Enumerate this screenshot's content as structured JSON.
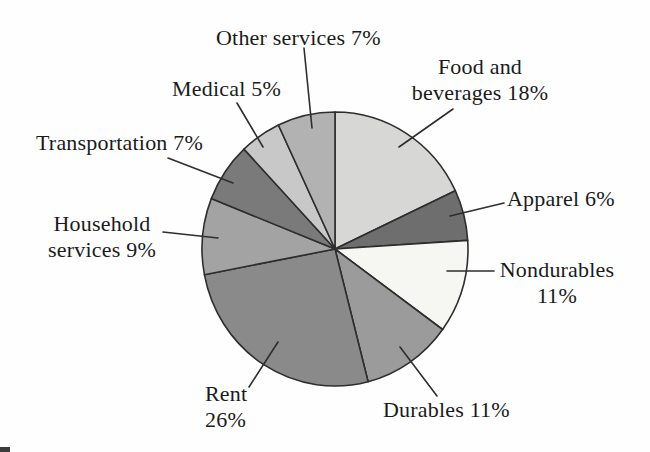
{
  "chart_data": {
    "type": "pie",
    "title": "",
    "legend": "none",
    "label_style": "external-labels-with-leader-lines",
    "categories": [
      "Food and beverages",
      "Apparel",
      "Nondurables",
      "Durables",
      "Rent",
      "Household services",
      "Transportation",
      "Medical",
      "Other services"
    ],
    "values": [
      18,
      6,
      11,
      11,
      26,
      9,
      7,
      5,
      7
    ],
    "start_angle_deg": 0,
    "direction": "clockwise",
    "center": {
      "x": 335,
      "y": 249
    },
    "radius": {
      "rx": 133,
      "ry": 137
    },
    "stroke_color": "#2e2e2e",
    "stroke_width": 1.6,
    "background_color": "#fefefe",
    "slices": [
      {
        "id": "food-and-beverages",
        "label": "Food and beverages",
        "value": 18,
        "percent_text": "18%",
        "display": "Food and\nbeverages 18%",
        "color": "#d7d7d5",
        "callout": [
          453,
          109,
          399,
          147
        ]
      },
      {
        "id": "apparel",
        "label": "Apparel",
        "value": 6,
        "percent_text": "6%",
        "display": "Apparel 6%",
        "color": "#6e6e6e",
        "callout": [
          504,
          203,
          450,
          216
        ]
      },
      {
        "id": "nondurables",
        "label": "Nondurables",
        "value": 11,
        "percent_text": "11%",
        "display": "Nondurables\n11%",
        "color": "#f6f6f3",
        "callout": [
          494,
          271,
          447,
          271
        ]
      },
      {
        "id": "durables",
        "label": "Durables",
        "value": 11,
        "percent_text": "11%",
        "display": "Durables 11%",
        "color": "#9b9b9b",
        "callout": [
          437,
          396,
          400,
          347
        ]
      },
      {
        "id": "rent",
        "label": "Rent",
        "value": 26,
        "percent_text": "26%",
        "display": "Rent\n26%",
        "color": "#8a8a8a",
        "callout": [
          249,
          387,
          278,
          342
        ]
      },
      {
        "id": "household-services",
        "label": "Household services",
        "value": 9,
        "percent_text": "9%",
        "display": "Household\nservices 9%",
        "color": "#a3a3a3",
        "callout": [
          163,
          232,
          218,
          238
        ]
      },
      {
        "id": "transportation",
        "label": "Transportation",
        "value": 7,
        "percent_text": "7%",
        "display": "Transportation 7%",
        "color": "#7a7a7a",
        "callout": [
          168,
          158,
          233,
          183
        ]
      },
      {
        "id": "medical",
        "label": "Medical",
        "value": 5,
        "percent_text": "5%",
        "display": "Medical 5%",
        "color": "#c8c8c8",
        "callout": [
          237,
          103,
          263,
          147
        ]
      },
      {
        "id": "other-services",
        "label": "Other services",
        "value": 7,
        "percent_text": "7%",
        "display": "Other services 7%",
        "color": "#b2b2b2",
        "callout": [
          304,
          48,
          312,
          128
        ]
      }
    ]
  }
}
